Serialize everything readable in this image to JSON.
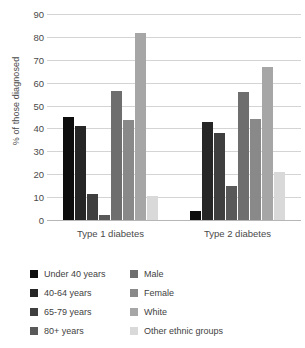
{
  "chart_data": {
    "type": "bar",
    "title": "",
    "xlabel": "",
    "ylabel": "% of those diagnosed",
    "ylim": [
      0,
      90
    ],
    "yticks": [
      90,
      80,
      70,
      60,
      50,
      40,
      30,
      20,
      10,
      0
    ],
    "grid": true,
    "legend_position": "bottom",
    "categories": [
      "Type 1 diabetes",
      "Type 2 diabetes"
    ],
    "series": [
      {
        "name": "Under 40 years",
        "color": "#0d0d0d",
        "values": [
          45,
          4
        ]
      },
      {
        "name": "40-64 years",
        "color": "#262626",
        "values": [
          41,
          43
        ]
      },
      {
        "name": "65-79 years",
        "color": "#3f3f3f",
        "values": [
          11.5,
          38
        ]
      },
      {
        "name": "80+ years",
        "color": "#595959",
        "values": [
          2,
          15
        ]
      },
      {
        "name": "Male",
        "color": "#6e6e6e",
        "values": [
          56.5,
          56
        ]
      },
      {
        "name": "Female",
        "color": "#898989",
        "values": [
          43.5,
          44
        ]
      },
      {
        "name": "White",
        "color": "#a6a6a6",
        "values": [
          81.5,
          67
        ]
      },
      {
        "name": "Other ethnic groups",
        "color": "#d9d9d9",
        "values": [
          10.5,
          21
        ]
      }
    ]
  }
}
